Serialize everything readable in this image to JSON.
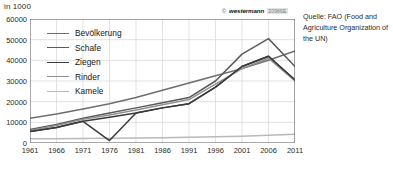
{
  "unit_label": "in 1000",
  "copyright": {
    "mark": "©",
    "brand": "westermann",
    "code": "20986E"
  },
  "source": "Quelle: FAO (Food and Agriculture Organization of the UN)",
  "legend": [
    {
      "label": "Bevölkerung",
      "color": "#6d6d6d"
    },
    {
      "label": "Schafe",
      "color": "#5a5a5a"
    },
    {
      "label": "Ziegen",
      "color": "#3a3a3a"
    },
    {
      "label": "Rinder",
      "color": "#909090"
    },
    {
      "label": "Kamele",
      "color": "#b9b9b9"
    }
  ],
  "chart_data": {
    "type": "line",
    "title": "",
    "xlabel": "",
    "ylabel": "in 1000",
    "unit": "in 1000",
    "x": [
      1961,
      1966,
      1971,
      1976,
      1981,
      1986,
      1991,
      1996,
      2001,
      2006,
      2011
    ],
    "xlim": [
      1961,
      2011
    ],
    "ylim": [
      0,
      60000
    ],
    "yticks": [
      0,
      10000,
      20000,
      30000,
      40000,
      50000,
      60000
    ],
    "xticks": [
      1961,
      1966,
      1971,
      1976,
      1981,
      1986,
      1991,
      1996,
      2001,
      2006,
      2011
    ],
    "grid": true,
    "legend_position": "top-left",
    "series": [
      {
        "name": "Bevölkerung",
        "color": "#6d6d6d",
        "values": [
          12000,
          14000,
          16500,
          19000,
          22000,
          25500,
          29000,
          32500,
          36000,
          40000,
          44500
        ]
      },
      {
        "name": "Schafe",
        "color": "#5a5a5a",
        "values": [
          6500,
          9000,
          12000,
          14500,
          17000,
          19500,
          22000,
          30000,
          43000,
          50500,
          37000
        ]
      },
      {
        "name": "Ziegen",
        "color": "#3a3a3a",
        "values": [
          5500,
          7500,
          10500,
          12500,
          14500,
          17000,
          19000,
          27000,
          37000,
          42000,
          30500
        ]
      },
      {
        "name": "Rinder",
        "color": "#909090",
        "values": [
          6000,
          8500,
          11500,
          13500,
          16000,
          18500,
          21000,
          28500,
          36000,
          41000,
          30000
        ]
      },
      {
        "name": "Kamele",
        "color": "#b9b9b9",
        "values": [
          2000,
          2100,
          2200,
          2300,
          2450,
          2600,
          2800,
          3000,
          3300,
          3700,
          4200
        ]
      }
    ],
    "annotations": [
      {
        "series": "Ziegen",
        "x": 1976,
        "y": 1200,
        "note": "sharp drop near zero in 1976"
      },
      {
        "series": "Schafe",
        "x": 2006,
        "y": 50500,
        "note": "peak"
      }
    ]
  }
}
